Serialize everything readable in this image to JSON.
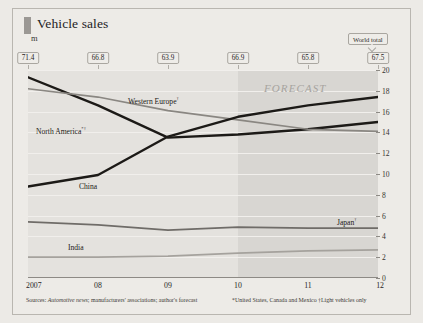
{
  "header": {
    "title": "Vehicle sales",
    "unit": "m",
    "world_total_label": "World total",
    "forecast_label": "FORECAST"
  },
  "footer": {
    "source_prefix": "Sources: ",
    "source_italic": "Automotive news",
    "source_rest": "; manufacturers' associations; author's forecast",
    "notes": "*United States, Canada and Mexico †Light vehicles only"
  },
  "chart_data": {
    "type": "line",
    "title": "Vehicle sales",
    "subtitle": "m",
    "xlabel": "",
    "ylabel": "m",
    "ylim": [
      0,
      20
    ],
    "yticks": [
      0,
      2,
      4,
      6,
      8,
      10,
      12,
      14,
      16,
      18,
      20
    ],
    "grid": true,
    "legend_position": "inline-labels",
    "x": [
      "2007",
      "08",
      "09",
      "10",
      "11",
      "12"
    ],
    "xtick_labels": [
      "2007",
      "08",
      "09",
      "10",
      "11",
      "12"
    ],
    "forecast_from": "10",
    "annotations": [
      "FORECAST"
    ],
    "world_total": {
      "label": "World total",
      "values": [
        71.4,
        66.8,
        63.9,
        66.9,
        65.8,
        67.5
      ]
    },
    "series": [
      {
        "name": "North America*†",
        "label": "North America",
        "label_sup": "*†",
        "color": "#1c1a17",
        "values": [
          19.3,
          16.6,
          13.5,
          13.8,
          14.3,
          15.0
        ]
      },
      {
        "name": "Western Europe†",
        "label": "Western Europe",
        "label_sup": "†",
        "color": "#8a8782",
        "values": [
          18.2,
          17.4,
          16.1,
          15.2,
          14.3,
          14.1
        ]
      },
      {
        "name": "China",
        "label": "China",
        "label_sup": "",
        "color": "#1c1a17",
        "values": [
          8.8,
          9.9,
          13.6,
          15.5,
          16.6,
          17.4
        ]
      },
      {
        "name": "Japan†",
        "label": "Japan",
        "label_sup": "†",
        "color": "#6f6c68",
        "values": [
          5.4,
          5.1,
          4.6,
          4.9,
          4.8,
          4.8
        ]
      },
      {
        "name": "India",
        "label": "India",
        "label_sup": "",
        "color": "#a5a29d",
        "values": [
          2.0,
          2.0,
          2.1,
          2.4,
          2.6,
          2.7
        ]
      }
    ]
  }
}
